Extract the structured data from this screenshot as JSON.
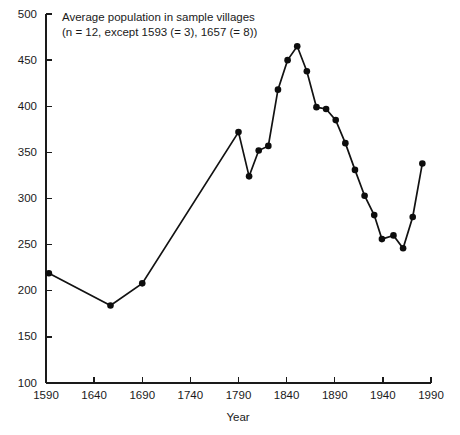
{
  "chart_data": {
    "type": "line",
    "title": "Average population in sample villages",
    "subtitle": "(n = 12, except 1593 (= 3), 1657 (= 8))",
    "xlabel": "Year",
    "ylabel": "",
    "xlim": [
      1590,
      1990
    ],
    "ylim": [
      100,
      500
    ],
    "xticks": [
      1590,
      1640,
      1690,
      1740,
      1790,
      1840,
      1890,
      1940,
      1990
    ],
    "yticks": [
      100,
      150,
      200,
      250,
      300,
      350,
      400,
      450,
      500
    ],
    "xtick_labels": [
      "1590",
      "1640",
      "1690",
      "1740",
      "1790",
      "1840",
      "1890",
      "1940",
      "1990"
    ],
    "ytick_labels": [
      "100",
      "150",
      "200",
      "250",
      "300",
      "350",
      "400",
      "450",
      "500"
    ],
    "grid": false,
    "legend": false,
    "marker": "circle",
    "line_color": "#121212",
    "marker_color": "#0d0d0d",
    "series": [
      {
        "name": "Average population",
        "x": [
          1593,
          1657,
          1690,
          1790,
          1801,
          1811,
          1821,
          1831,
          1841,
          1851,
          1861,
          1871,
          1881,
          1891,
          1901,
          1911,
          1921,
          1931,
          1939,
          1951,
          1961,
          1971,
          1981
        ],
        "y": [
          219,
          184,
          208,
          372,
          324,
          352,
          357,
          418,
          450,
          465,
          438,
          399,
          397,
          385,
          360,
          331,
          303,
          282,
          256,
          260,
          246,
          280,
          338
        ]
      }
    ]
  },
  "axes": {
    "x_axis_name": "year-axis",
    "y_axis_name": "population-axis"
  }
}
